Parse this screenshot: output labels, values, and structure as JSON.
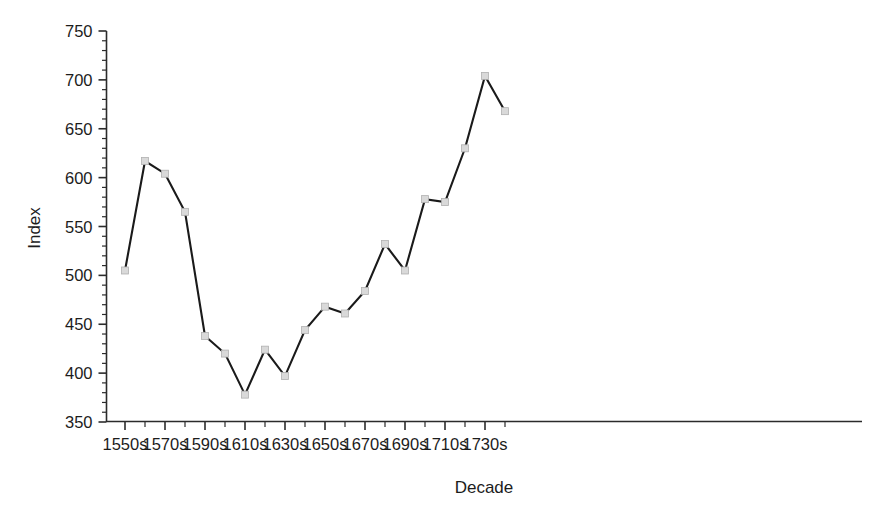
{
  "chart_data": {
    "type": "line",
    "title": "",
    "xlabel": "Decade",
    "ylabel": "Index",
    "categories": [
      "1550s",
      "1560s",
      "1570s",
      "1580s",
      "1590s",
      "1600s",
      "1610s",
      "1620s",
      "1630s",
      "1640s",
      "1650s",
      "1660s",
      "1670s",
      "1680s",
      "1690s",
      "1700s",
      "1710s",
      "1720s",
      "1730s",
      "1740s"
    ],
    "values": [
      505,
      617,
      604,
      565,
      438,
      420,
      378,
      424,
      397,
      444,
      468,
      461,
      484,
      532,
      505,
      578,
      575,
      630,
      704,
      668
    ],
    "xlim": [
      "1550s",
      "1740s"
    ],
    "ylim": [
      350,
      750
    ],
    "y_ticks": [
      350,
      400,
      450,
      500,
      550,
      600,
      650,
      700,
      750
    ],
    "y_tick_labels": [
      "350",
      "400",
      "450",
      "500",
      "550",
      "600",
      "650",
      "700",
      "750"
    ],
    "y_minor_tick_step": 10,
    "x_tick_labels": [
      "1550s",
      "1570s",
      "1590s",
      "1610s",
      "1630s",
      "1650s",
      "1670s",
      "1690s",
      "1710s",
      "1730s"
    ],
    "x_minor_ticks": true,
    "grid": false,
    "legend": null,
    "series": [
      {
        "name": "Index",
        "marker": "square",
        "marker_color": "#d9d9d9",
        "marker_edge_color": "#b0b0b0",
        "line_color": "#1a1a1a",
        "values": [
          505,
          617,
          604,
          565,
          438,
          420,
          378,
          424,
          397,
          444,
          468,
          461,
          484,
          532,
          505,
          578,
          575,
          630,
          704,
          668
        ]
      }
    ]
  },
  "colors": {
    "background": "#ffffff",
    "axis": "#2b2b2b",
    "line": "#1a1a1a",
    "marker_fill": "#d9d9d9",
    "text": "#1c1c1c"
  }
}
